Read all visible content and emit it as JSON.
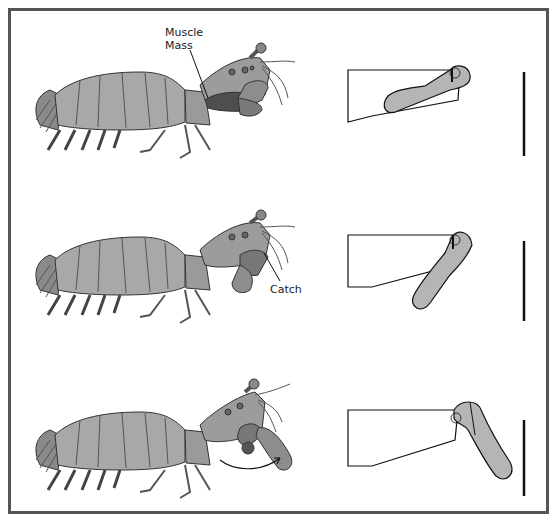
{
  "figure": {
    "title": "",
    "stages": [
      {
        "id": "stage-1",
        "description": "cocked / loaded",
        "callout": "Muscle\nMass",
        "callout_lines": [
          "Muscle",
          "Mass"
        ]
      },
      {
        "id": "stage-2",
        "description": "catch engaged",
        "callout": "Catch",
        "callout_lines": [
          "Catch"
        ]
      },
      {
        "id": "stage-3",
        "description": "strike released",
        "callout": "",
        "callout_lines": []
      }
    ],
    "labels": {
      "muscle_line1": "Muscle",
      "muscle_line2": "Mass",
      "catch": "Catch"
    },
    "colors": {
      "border": "#555555",
      "appendage_fill": "#b5b5b5",
      "outline": "#111111",
      "body_light": "#a8a8a8",
      "body_dark": "#6e6e6e",
      "background": "#ffffff"
    }
  }
}
